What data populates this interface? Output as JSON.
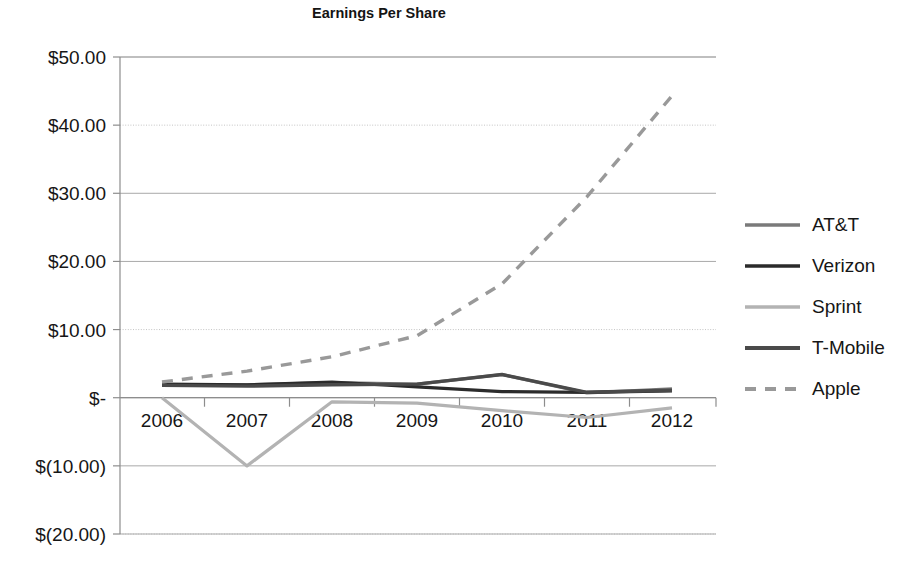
{
  "chart_data": {
    "type": "line",
    "title": "Earnings Per Share",
    "xlabel": "",
    "ylabel": "",
    "x": [
      2006,
      2007,
      2008,
      2009,
      2010,
      2011,
      2012
    ],
    "categories": [
      "2006",
      "2007",
      "2008",
      "2009",
      "2010",
      "2011",
      "2012"
    ],
    "ylim": [
      -20,
      50
    ],
    "ytick_values": [
      50,
      40,
      30,
      20,
      10,
      0,
      -10,
      -20
    ],
    "ytick_labels": [
      "$50.00",
      "$40.00",
      "$30.00",
      "$20.00",
      "$10.00",
      "$-",
      "$(10.00)",
      "$(20.00)"
    ],
    "grid": true,
    "grid_axis": "y",
    "legend_position": "right",
    "series": [
      {
        "name": "AT&T",
        "color": "#7a7a7a",
        "width": 3.2,
        "dash": "none",
        "values": [
          1.9,
          1.9,
          2.2,
          2.0,
          3.4,
          0.7,
          1.3
        ]
      },
      {
        "name": "Verizon",
        "color": "#2b2b2b",
        "width": 3.2,
        "dash": "none",
        "values": [
          2.0,
          1.9,
          2.3,
          1.6,
          0.9,
          0.8,
          1.0
        ]
      },
      {
        "name": "Sprint",
        "color": "#b3b3b3",
        "width": 3.2,
        "dash": "none",
        "values": [
          0.0,
          -10.0,
          -0.6,
          -0.8,
          -1.9,
          -2.9,
          -1.5
        ]
      },
      {
        "name": "T-Mobile",
        "color": "#4a4a4a",
        "width": 3.4,
        "dash": "none",
        "values": [
          1.8,
          1.7,
          1.9,
          2.0,
          3.4,
          0.8,
          1.1
        ]
      },
      {
        "name": "Apple",
        "color": "#999999",
        "width": 3.4,
        "dash": "dashed",
        "values": [
          2.3,
          3.9,
          6.0,
          9.1,
          16.7,
          29.5,
          44.3
        ]
      }
    ]
  },
  "colors": {
    "gridline_solid": "#a9a9a9",
    "gridline_dotted": "#c4c4c4",
    "axis": "#8d8d8d",
    "text": "#161616",
    "background": "#ffffff"
  }
}
